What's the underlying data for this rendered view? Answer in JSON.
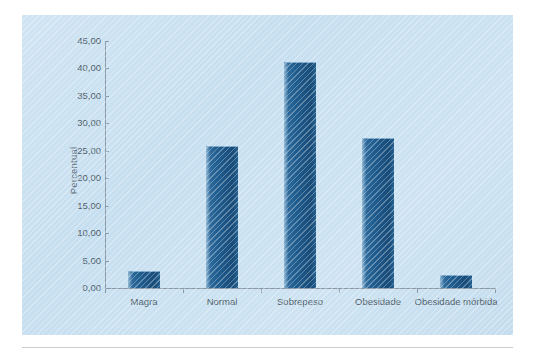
{
  "chart_data": {
    "type": "bar",
    "title": "",
    "subtitle": "",
    "xlabel": "",
    "ylabel": "Percentual",
    "categories": [
      "Magra",
      "Normal",
      "Sobrepeso",
      "Obesidade",
      "Obesidade mórbida"
    ],
    "values": [
      3.1,
      25.9,
      41.2,
      27.3,
      2.4
    ],
    "series": [
      {
        "name": "Percentual",
        "values": [
          3.1,
          25.9,
          41.2,
          27.3,
          2.4
        ]
      }
    ],
    "ylim": [
      0,
      45
    ],
    "ytick_step": 5,
    "ytick_labels": [
      "0,00",
      "5,00",
      "10,00",
      "15,00",
      "20,00",
      "25,00",
      "30,00",
      "35,00",
      "40,00",
      "45,00"
    ],
    "ytick_values": [
      0,
      5,
      10,
      15,
      20,
      25,
      30,
      35,
      40,
      45
    ],
    "grid": false,
    "legend": false,
    "legend_position": "none",
    "decimal_separator": ",",
    "colors": {
      "bar_light": "#8fb7d4",
      "bar_mid": "#2d6a9b",
      "bar_dark": "#184c79",
      "panel_background": "#c8e0f0",
      "axis": "#8a9aa6",
      "tick_text": "#4e5d6a",
      "axis_label_text": "#5c6b78",
      "page_background": "#ffffff",
      "rule": "#c9cdd0"
    }
  },
  "figure": {
    "panel_present": true,
    "bottom_rule_present": true
  }
}
